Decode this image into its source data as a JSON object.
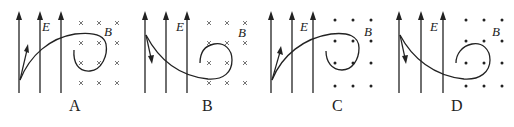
{
  "figure": {
    "field_labels": {
      "electric": "E",
      "magnetic": "B"
    },
    "panels": [
      {
        "caption": "A",
        "magnetic_field_direction": "into-page",
        "mark": "×",
        "initial_velocity": "up-right",
        "trajectory": "curves up-right into B then circles clockwise"
      },
      {
        "caption": "B",
        "magnetic_field_direction": "into-page",
        "mark": "×",
        "initial_velocity": "down",
        "trajectory": "curves down-right into B then circles counterclockwise"
      },
      {
        "caption": "C",
        "magnetic_field_direction": "out-of-page",
        "mark": "•",
        "initial_velocity": "up-right",
        "trajectory": "curves up-right into B then circles clockwise"
      },
      {
        "caption": "D",
        "magnetic_field_direction": "out-of-page",
        "mark": "•",
        "initial_velocity": "down",
        "trajectory": "curves down-right into B then circles counterclockwise"
      }
    ]
  }
}
